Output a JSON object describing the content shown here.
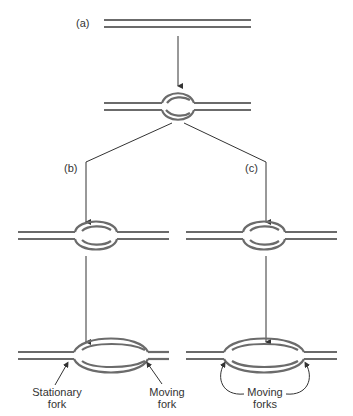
{
  "diagram": {
    "type": "DNA replication bubble / fork progression",
    "colors": {
      "strand": "#6b6b6b",
      "arrow": "#333333",
      "text": "#333333",
      "background": "#ffffff"
    },
    "labels": {
      "a": "(a)",
      "b": "(b)",
      "c": "(c)",
      "stationary_fork_line1": "Stationary",
      "stationary_fork_line2": "fork",
      "moving_fork_line1": "Moving",
      "moving_fork_line2": "fork",
      "moving_forks_line1": "Moving",
      "moving_forks_line2": "forks"
    },
    "stages": [
      {
        "id": "a-unreplicated",
        "description": "Double-stranded DNA"
      },
      {
        "id": "a-bubble",
        "description": "Small replication bubble"
      },
      {
        "id": "b-bubble-small",
        "description": "Bubble, unidirectional path"
      },
      {
        "id": "b-bubble-large",
        "description": "Enlarged bubble with one stationary and one moving fork"
      },
      {
        "id": "c-bubble-small",
        "description": "Bubble, bidirectional path"
      },
      {
        "id": "c-bubble-large",
        "description": "Enlarged bubble with two moving forks"
      }
    ]
  }
}
